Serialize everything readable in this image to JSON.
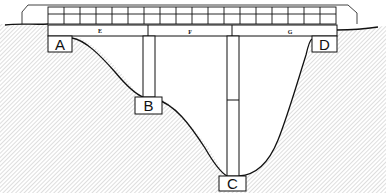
{
  "diagram": {
    "title": "",
    "type": "bridge cross-section",
    "supports": [
      {
        "id": "A",
        "label": "A",
        "kind": "abutment",
        "position": "left"
      },
      {
        "id": "B",
        "label": "B",
        "kind": "pier-footing",
        "position": "left-middle"
      },
      {
        "id": "C",
        "label": "C",
        "kind": "pier-footing",
        "position": "valley-bottom"
      },
      {
        "id": "D",
        "label": "D",
        "kind": "abutment",
        "position": "right"
      }
    ],
    "spans": [
      {
        "id": "E",
        "label": "E"
      },
      {
        "id": "F",
        "label": "F"
      },
      {
        "id": "G",
        "label": "G"
      }
    ],
    "colors": {
      "line": "#111111",
      "fill": "#ffffff",
      "hatch": "#555555"
    }
  }
}
